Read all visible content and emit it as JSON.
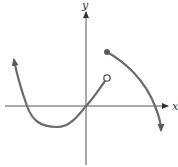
{
  "graph": {
    "axes": {
      "x_label": "x",
      "y_label": "y"
    },
    "pieces": [
      {
        "name": "left-piece",
        "description": "curve from upper-left (arrow) dipping below x-axis, passing through origin, ending at open circle",
        "start": "arrow",
        "end": "open-circle"
      },
      {
        "name": "right-piece",
        "description": "curve starting at filled dot above open circle, decreasing through x-axis, ending with downward arrow",
        "start": "filled-dot",
        "end": "arrow"
      }
    ],
    "colors": {
      "curve": "#6a6a6a",
      "axis": "#555555",
      "background": "#ffffff"
    }
  }
}
